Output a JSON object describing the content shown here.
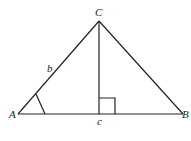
{
  "diagram": {
    "type": "triangle-with-altitude",
    "vertices": {
      "A": {
        "label": "A",
        "x": 18,
        "y": 114
      },
      "B": {
        "label": "B",
        "x": 183,
        "y": 114
      },
      "C": {
        "label": "C",
        "x": 99,
        "y": 21
      }
    },
    "side_labels": {
      "b": "b",
      "c": "c"
    },
    "altitude_foot": {
      "x": 99,
      "y": 114
    },
    "marks": [
      "angle-A-arc",
      "right-angle-at-foot"
    ],
    "colors": {
      "stroke": "#222222",
      "background": "#ffffff"
    }
  }
}
